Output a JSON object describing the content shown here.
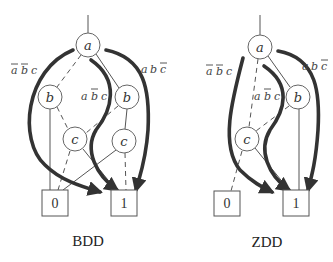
{
  "diagrams": [
    {
      "id": "bdd",
      "caption": "BDD",
      "root_stub": {
        "x": 88,
        "y1": 15,
        "y2": 33
      },
      "nodes": [
        {
          "id": "a",
          "label": "a",
          "x": 88,
          "y": 45
        },
        {
          "id": "b1",
          "label": "b",
          "x": 50,
          "y": 97
        },
        {
          "id": "b2",
          "label": "b",
          "x": 127,
          "y": 97
        },
        {
          "id": "c1",
          "label": "c",
          "x": 75,
          "y": 139
        },
        {
          "id": "c2",
          "label": "c",
          "x": 124,
          "y": 141
        }
      ],
      "terminals": [
        {
          "id": "t0",
          "label": "0",
          "x": 55,
          "y": 203
        },
        {
          "id": "t1",
          "label": "1",
          "x": 124,
          "y": 203
        }
      ],
      "paths": [
        {
          "label": "ā b̄ c",
          "lx": 10,
          "ly": 70
        },
        {
          "label": "a b̄ c",
          "lx": 80,
          "ly": 97
        },
        {
          "label": "a b c̄",
          "lx": 140,
          "ly": 70
        }
      ]
    },
    {
      "id": "zdd",
      "caption": "ZDD",
      "root_stub": {
        "x": 260,
        "y1": 15,
        "y2": 35
      },
      "nodes": [
        {
          "id": "a",
          "label": "a",
          "x": 260,
          "y": 47
        },
        {
          "id": "b",
          "label": "b",
          "x": 298,
          "y": 97
        },
        {
          "id": "c",
          "label": "c",
          "x": 247,
          "y": 139
        }
      ],
      "terminals": [
        {
          "id": "t0",
          "label": "0",
          "x": 228,
          "y": 203
        },
        {
          "id": "t1",
          "label": "1",
          "x": 296,
          "y": 203
        }
      ],
      "paths": [
        {
          "label": "ā b̄ c",
          "lx": 206,
          "ly": 72
        },
        {
          "label": "a b̄ c",
          "lx": 253,
          "ly": 97
        },
        {
          "label": "a b c̄",
          "lx": 302,
          "ly": 67
        }
      ]
    }
  ],
  "legend": {
    "solid_edge": "high (1) branch",
    "dashed_edge": "low (0) branch",
    "thick_arrow": "path to terminal 1"
  }
}
